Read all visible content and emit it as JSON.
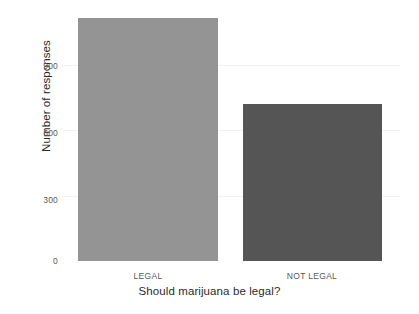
{
  "chart_data": {
    "type": "bar",
    "title": "",
    "subtitle": "",
    "xlabel": "Should marijuana be legal?",
    "ylabel": "Number of responses",
    "categories": [
      "LEGAL",
      "NOT LEGAL"
    ],
    "values": [
      1115,
      720
    ],
    "series": [
      {
        "name": "Number of responses",
        "values": [
          1115,
          720
        ]
      }
    ],
    "colors": [
      "#949494",
      "#555555"
    ],
    "ylim": [
      0,
      1160
    ],
    "yticks": [
      0,
      300,
      600,
      900
    ],
    "ytick_labels": [
      "0",
      "300",
      "600",
      "900"
    ],
    "grid": true,
    "grid_axis": "y",
    "legend": false,
    "legend_position": "none",
    "background": "#ffffff",
    "annotations": []
  },
  "axes": {
    "y_title": "Number of responses",
    "x_title": "Should marijuana be legal?",
    "y_tick_labels": [
      "900",
      "600",
      "300",
      "0"
    ],
    "x_tick_labels": [
      "LEGAL",
      "NOT LEGAL"
    ]
  }
}
